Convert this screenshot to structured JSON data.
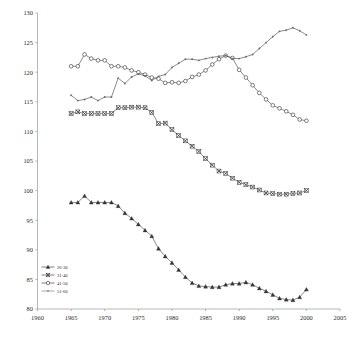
{
  "chart_data": {
    "type": "line",
    "title": "",
    "subtitle": "",
    "xlabel": "",
    "ylabel": "",
    "xlim": [
      1960,
      2005
    ],
    "ylim": [
      80,
      130
    ],
    "xticks": [
      1960,
      1965,
      1970,
      1975,
      1980,
      1985,
      1990,
      1995,
      2000,
      2005
    ],
    "yticks": [
      80,
      85,
      90,
      95,
      100,
      105,
      110,
      115,
      120,
      125,
      130
    ],
    "grid": false,
    "legend_position": "bottom-left",
    "series": [
      {
        "name": "26-30",
        "marker": "triangle",
        "color": "#333333",
        "x": [
          1965,
          1966,
          1967,
          1968,
          1969,
          1970,
          1971,
          1972,
          1973,
          1974,
          1975,
          1976,
          1977,
          1978,
          1979,
          1980,
          1981,
          1982,
          1983,
          1984,
          1985,
          1986,
          1987,
          1988,
          1989,
          1990,
          1991,
          1992,
          1993,
          1994,
          1995,
          1996,
          1997,
          1998,
          1999,
          2000
        ],
        "values": [
          98.0,
          98.0,
          99.1,
          98.0,
          98.0,
          98.0,
          98.0,
          97.4,
          96.2,
          95.3,
          94.3,
          93.3,
          92.3,
          90.2,
          88.9,
          87.8,
          86.6,
          85.4,
          84.4,
          83.9,
          83.8,
          83.7,
          83.7,
          84.1,
          84.3,
          84.3,
          84.5,
          84.1,
          83.5,
          83.0,
          82.4,
          81.8,
          81.6,
          81.5,
          82.0,
          83.3
        ]
      },
      {
        "name": "31-40",
        "marker": "x-box",
        "color": "#333333",
        "x": [
          1965,
          1966,
          1967,
          1968,
          1969,
          1970,
          1971,
          1972,
          1973,
          1974,
          1975,
          1976,
          1977,
          1978,
          1979,
          1980,
          1981,
          1982,
          1983,
          1984,
          1985,
          1986,
          1987,
          1988,
          1989,
          1990,
          1991,
          1992,
          1993,
          1994,
          1995,
          1996,
          1997,
          1998,
          1999,
          2000
        ],
        "values": [
          113.0,
          113.3,
          113.0,
          113.0,
          113.0,
          113.0,
          113.0,
          114.0,
          114.0,
          114.1,
          114.1,
          114.0,
          113.2,
          111.3,
          111.4,
          110.3,
          109.3,
          108.4,
          107.5,
          106.6,
          105.4,
          104.3,
          103.3,
          102.9,
          102.1,
          101.4,
          101.0,
          100.6,
          100.1,
          99.6,
          99.5,
          99.4,
          99.4,
          99.5,
          99.6,
          100.0
        ]
      },
      {
        "name": "41-50",
        "marker": "circle",
        "color": "#333333",
        "x": [
          1965,
          1966,
          1967,
          1968,
          1969,
          1970,
          1971,
          1972,
          1973,
          1974,
          1975,
          1976,
          1977,
          1978,
          1979,
          1980,
          1981,
          1982,
          1983,
          1984,
          1985,
          1986,
          1987,
          1988,
          1989,
          1990,
          1991,
          1992,
          1993,
          1994,
          1995,
          1996,
          1997,
          1998,
          1999,
          2000
        ],
        "values": [
          121.0,
          121.0,
          123.0,
          122.3,
          122.0,
          122.0,
          121.0,
          121.0,
          120.8,
          120.3,
          120.0,
          119.6,
          119.1,
          118.9,
          118.2,
          118.3,
          118.2,
          118.5,
          119.2,
          119.6,
          120.3,
          121.3,
          122.2,
          122.8,
          122.4,
          120.4,
          119.1,
          117.8,
          116.5,
          115.4,
          114.4,
          113.9,
          113.4,
          112.8,
          112.0,
          111.8
        ]
      },
      {
        "name": "51-60",
        "marker": "dot",
        "color": "#6e6e6e",
        "x": [
          1965,
          1966,
          1967,
          1968,
          1969,
          1970,
          1971,
          1972,
          1973,
          1974,
          1975,
          1976,
          1977,
          1978,
          1979,
          1980,
          1981,
          1982,
          1983,
          1984,
          1985,
          1986,
          1987,
          1988,
          1989,
          1990,
          1991,
          1992,
          1993,
          1994,
          1995,
          1996,
          1997,
          1998,
          1999,
          2000
        ],
        "values": [
          116.1,
          115.2,
          115.4,
          115.8,
          115.2,
          115.8,
          115.8,
          119.0,
          118.1,
          119.2,
          119.7,
          119.4,
          118.6,
          119.3,
          119.6,
          120.8,
          121.5,
          122.2,
          122.2,
          122.0,
          122.3,
          122.5,
          122.7,
          122.8,
          122.3,
          122.3,
          122.6,
          123.0,
          124.0,
          125.0,
          126.0,
          126.9,
          127.1,
          127.5,
          127.0,
          126.3
        ]
      }
    ],
    "legend": [
      {
        "label": "26-30",
        "marker": "triangle"
      },
      {
        "label": "31-40",
        "marker": "x-box"
      },
      {
        "label": "41-50",
        "marker": "circle"
      },
      {
        "label": "51-60",
        "marker": "dot"
      }
    ]
  }
}
